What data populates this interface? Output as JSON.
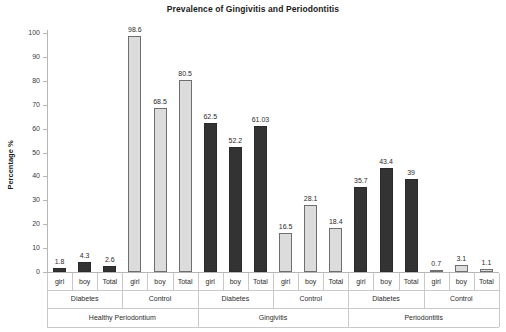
{
  "chart_data": {
    "type": "bar",
    "title": "Prevalence of Gingivitis and Periodontitis",
    "xlabel": "",
    "ylabel": "Percentage %",
    "ylim": [
      0,
      100
    ],
    "yticks": [
      0,
      10,
      20,
      30,
      40,
      50,
      60,
      70,
      80,
      90,
      100
    ],
    "grid": false,
    "legend": "none",
    "categories": [
      "girl",
      "boy",
      "Total"
    ],
    "group_level_2": [
      "Diabetes",
      "Control"
    ],
    "group_level_3": [
      "Healthy Periodontium",
      "Gingivitis",
      "Periodontitis"
    ],
    "colors": {
      "diabetes_bar": "#333333",
      "control_bar": "#dcdcdc",
      "axis": "#b6b6b6",
      "text": "#2b2b2b"
    },
    "bars": [
      {
        "condition": "Healthy Periodontium",
        "group": "Diabetes",
        "category": "girl",
        "value": 1.8,
        "label": "1.8",
        "style": "dark"
      },
      {
        "condition": "Healthy Periodontium",
        "group": "Diabetes",
        "category": "boy",
        "value": 4.3,
        "label": "4.3",
        "style": "dark"
      },
      {
        "condition": "Healthy Periodontium",
        "group": "Diabetes",
        "category": "Total",
        "value": 2.6,
        "label": "2.6",
        "style": "dark"
      },
      {
        "condition": "Healthy Periodontium",
        "group": "Control",
        "category": "girl",
        "value": 98.6,
        "label": "98.6",
        "style": "light"
      },
      {
        "condition": "Healthy Periodontium",
        "group": "Control",
        "category": "boy",
        "value": 68.5,
        "label": "68.5",
        "style": "light"
      },
      {
        "condition": "Healthy Periodontium",
        "group": "Control",
        "category": "Total",
        "value": 80.5,
        "label": "80.5",
        "style": "light"
      },
      {
        "condition": "Gingivitis",
        "group": "Diabetes",
        "category": "girl",
        "value": 62.5,
        "label": "62.5",
        "style": "dark"
      },
      {
        "condition": "Gingivitis",
        "group": "Diabetes",
        "category": "boy",
        "value": 52.2,
        "label": "52.2",
        "style": "dark"
      },
      {
        "condition": "Gingivitis",
        "group": "Diabetes",
        "category": "Total",
        "value": 61.03,
        "label": "61.03",
        "style": "dark"
      },
      {
        "condition": "Gingivitis",
        "group": "Control",
        "category": "girl",
        "value": 16.5,
        "label": "16.5",
        "style": "light"
      },
      {
        "condition": "Gingivitis",
        "group": "Control",
        "category": "boy",
        "value": 28.1,
        "label": "28.1",
        "style": "light"
      },
      {
        "condition": "Gingivitis",
        "group": "Control",
        "category": "Total",
        "value": 18.4,
        "label": "18.4",
        "style": "light"
      },
      {
        "condition": "Periodontitis",
        "group": "Diabetes",
        "category": "girl",
        "value": 35.7,
        "label": "35.7",
        "style": "dark"
      },
      {
        "condition": "Periodontitis",
        "group": "Diabetes",
        "category": "boy",
        "value": 43.4,
        "label": "43.4",
        "style": "dark"
      },
      {
        "condition": "Periodontitis",
        "group": "Diabetes",
        "category": "Total",
        "value": 39,
        "label": "39",
        "style": "dark"
      },
      {
        "condition": "Periodontitis",
        "group": "Control",
        "category": "girl",
        "value": 0.7,
        "label": "0.7",
        "style": "light"
      },
      {
        "condition": "Periodontitis",
        "group": "Control",
        "category": "boy",
        "value": 3.1,
        "label": "3.1",
        "style": "light"
      },
      {
        "condition": "Periodontitis",
        "group": "Control",
        "category": "Total",
        "value": 1.1,
        "label": "1.1",
        "style": "light"
      }
    ]
  }
}
